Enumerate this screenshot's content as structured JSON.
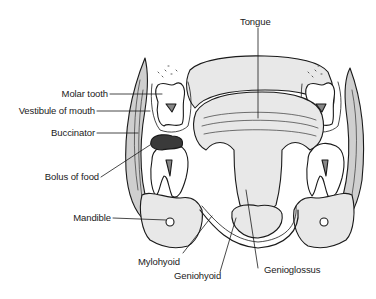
{
  "diagram": {
    "colors": {
      "line": "#1a1a1a",
      "fill_light": "#e8e8e8",
      "fill_mid": "#cfcfcf",
      "bolus": "#3a3a3a",
      "background": "#ffffff"
    },
    "labels": {
      "tongue": "Tongue",
      "molar_tooth": "Molar tooth",
      "vestibule": "Vestibule of mouth",
      "buccinator": "Buccinator",
      "bolus": "Bolus of food",
      "mandible": "Mandible",
      "mylohyoid": "Mylohyoid",
      "geniohyoid": "Geniohyoid",
      "genioglossus": "Genioglossus"
    }
  }
}
